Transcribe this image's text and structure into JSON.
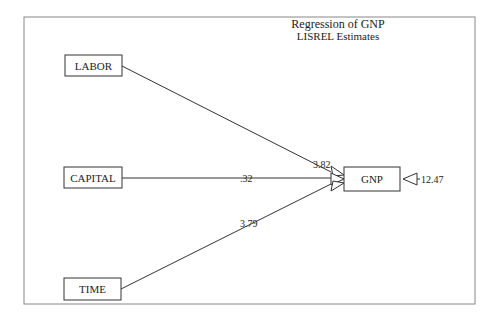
{
  "title": {
    "line1": "Regression  of  GNP",
    "line2": "LISREL Estimates"
  },
  "nodes": {
    "labor": "LABOR",
    "capital": "CAPITAL",
    "time": "TIME",
    "gnp": "GNP"
  },
  "paths": {
    "labor_gnp": "3.82",
    "capital_gnp": ".32",
    "time_gnp": "3.79",
    "error_gnp": "12.47"
  }
}
